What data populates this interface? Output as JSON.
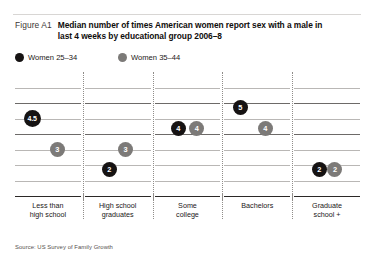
{
  "figure": {
    "label": "Figure A1",
    "title": "Median number of times American women report sex with a male in last 4 weeks by educational group 2006–8",
    "source": "Source: US Survey of Family Growth"
  },
  "legend": {
    "items": [
      {
        "label": "Women 25–34",
        "color": "#161313",
        "series": "women_25_34"
      },
      {
        "label": "Women 35–44",
        "color": "#7c7a78",
        "series": "women_35_44"
      }
    ]
  },
  "chart_data": {
    "type": "scatter",
    "title": "Median number of times American women report sex with a male in last 4 weeks by educational group 2006–8",
    "xlabel": "",
    "ylabel": "",
    "ylim": [
      0,
      7
    ],
    "grid": true,
    "legend_position": "top-left",
    "categories": [
      "Less than high school",
      "High school graduates",
      "Some college",
      "Bachelors",
      "Graduate school +"
    ],
    "series": [
      {
        "name": "Women 25–34",
        "color": "#161313",
        "values": [
          4.5,
          2,
          4,
          5,
          2
        ],
        "labels": [
          "4.5",
          "2",
          "4",
          "5",
          "2"
        ]
      },
      {
        "name": "Women 35–44",
        "color": "#7c7a78",
        "values": [
          3,
          3,
          4,
          4,
          2
        ],
        "labels": [
          "3",
          "3",
          "4",
          "4",
          "2"
        ]
      }
    ]
  },
  "panels": [
    {
      "category_line1": "Less than",
      "category_line2": "high school",
      "points": [
        {
          "series": "Women 25–34",
          "label": "4.5",
          "tone": "dark",
          "xpct": 26,
          "ypct": 37.5,
          "size": 17,
          "fontsize": 7.0
        },
        {
          "series": "Women 35–44",
          "label": "3",
          "tone": "gray",
          "xpct": 64,
          "ypct": 62.5,
          "size": 15,
          "fontsize": 7.4
        }
      ]
    },
    {
      "category_line1": "High school",
      "category_line2": "graduates",
      "points": [
        {
          "series": "Women 35–44",
          "label": "3",
          "tone": "gray",
          "xpct": 62,
          "ypct": 62.5,
          "size": 15,
          "fontsize": 7.4
        },
        {
          "series": "Women 25–34",
          "label": "2",
          "tone": "dark",
          "xpct": 37,
          "ypct": 79.0,
          "size": 15,
          "fontsize": 7.4
        }
      ]
    },
    {
      "category_line1": "Some",
      "category_line2": "college",
      "points": [
        {
          "series": "Women 25–34",
          "label": "4",
          "tone": "dark",
          "xpct": 36,
          "ypct": 45.5,
          "size": 15,
          "fontsize": 7.4
        },
        {
          "series": "Women 35–44",
          "label": "4",
          "tone": "gray",
          "xpct": 64,
          "ypct": 45.5,
          "size": 15,
          "fontsize": 7.4
        }
      ]
    },
    {
      "category_line1": "Bachelors",
      "category_line2": "",
      "points": [
        {
          "series": "Women 25–34",
          "label": "5",
          "tone": "dark",
          "xpct": 24,
          "ypct": 29.0,
          "size": 15,
          "fontsize": 7.4
        },
        {
          "series": "Women 35–44",
          "label": "4",
          "tone": "gray",
          "xpct": 62,
          "ypct": 45.5,
          "size": 15,
          "fontsize": 7.4
        }
      ]
    },
    {
      "category_line1": "Graduate",
      "category_line2": "school +",
      "points": [
        {
          "series": "Women 25–34",
          "label": "2",
          "tone": "dark",
          "xpct": 38,
          "ypct": 79.0,
          "size": 15,
          "fontsize": 7.4
        },
        {
          "series": "Women 35–44",
          "label": "2",
          "tone": "gray",
          "xpct": 62,
          "ypct": 79.0,
          "size": 15,
          "fontsize": 7.4
        }
      ]
    }
  ]
}
